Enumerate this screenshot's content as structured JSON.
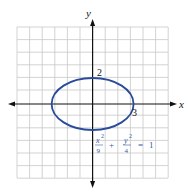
{
  "diagram": {
    "type": "ellipse-graph",
    "equation": {
      "x_num": "x",
      "x_exp": "2",
      "x_den": "9",
      "plus": "+",
      "y_num": "y",
      "y_exp": "2",
      "y_den": "4",
      "equals": "=",
      "rhs": "1"
    },
    "axes": {
      "x_label": "x",
      "y_label": "y"
    },
    "intercept_labels": {
      "y_intercept": "2",
      "x_intercept": "3"
    },
    "grid": {
      "columns": 12,
      "rows": 12,
      "x_range": [
        -6,
        6
      ],
      "y_range": [
        -6,
        6
      ]
    },
    "ellipse": {
      "center": [
        0,
        0
      ],
      "a": 3,
      "b": 2
    },
    "colors": {
      "curve": "#2a4a9a",
      "equation": "#3a5aa8",
      "grid": "#c8c8c8",
      "axis": "#111111"
    }
  }
}
